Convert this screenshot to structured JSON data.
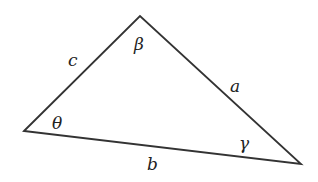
{
  "diagram": {
    "type": "triangle",
    "colors": {
      "line": "#333333",
      "text": "#222222",
      "background": "#ffffff"
    },
    "vertices": {
      "left": {
        "x": 24,
        "y": 131
      },
      "top": {
        "x": 140,
        "y": 16
      },
      "right": {
        "x": 301,
        "y": 164
      }
    },
    "sides": {
      "a": "a",
      "b": "b",
      "c": "c"
    },
    "angles": {
      "left": "θ",
      "top": "β",
      "right": "γ"
    }
  }
}
